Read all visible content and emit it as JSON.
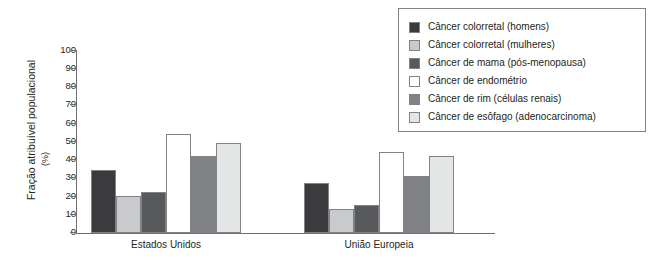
{
  "chart": {
    "type_note": "grouped-bar",
    "ylabel_main": "Fração atribuível populacional",
    "ylabel_unit": "(%)"
  },
  "chart_data": {
    "type": "bar",
    "title": "",
    "xlabel": "",
    "ylabel": "Fração atribuível populacional (%)",
    "ylim": [
      0,
      100
    ],
    "yticks": [
      0,
      10,
      20,
      30,
      40,
      50,
      60,
      70,
      80,
      90,
      100
    ],
    "grid": false,
    "legend_position": "top-right",
    "categories": [
      "Estados Unidos",
      "União Europeia"
    ],
    "series": [
      {
        "name": "Câncer colorretal (homens)",
        "color": "#3b3b3d",
        "values": [
          34,
          27
        ]
      },
      {
        "name": "Câncer colorretal (mulheres)",
        "color": "#c9cacb",
        "values": [
          20,
          13
        ]
      },
      {
        "name": "Câncer de mama (pós-menopausa)",
        "color": "#58595b",
        "values": [
          22,
          15
        ]
      },
      {
        "name": "Câncer de endométrio",
        "color": "#ffffff",
        "values": [
          54,
          44
        ]
      },
      {
        "name": "Câncer de rim (células renais)",
        "color": "#808285",
        "values": [
          42,
          31
        ]
      },
      {
        "name": "Câncer de esôfago (adenocarcinoma)",
        "color": "#e4e5e5",
        "values": [
          49,
          42
        ]
      }
    ]
  },
  "legend": {
    "items": [
      {
        "label": "Câncer colorretal (homens)",
        "color": "#3b3b3d"
      },
      {
        "label": "Câncer colorretal (mulheres)",
        "color": "#c9cacb"
      },
      {
        "label": "Câncer de mama (pós-menopausa)",
        "color": "#58595b"
      },
      {
        "label": "Câncer de endométrio",
        "color": "#ffffff"
      },
      {
        "label": "Câncer de rim (células renais)",
        "color": "#808285"
      },
      {
        "label": "Câncer de esôfago (adenocarcinoma)",
        "color": "#e4e5e5"
      }
    ]
  }
}
